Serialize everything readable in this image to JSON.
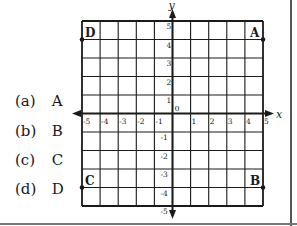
{
  "options": [
    {
      "label": "(a)",
      "value": "A"
    },
    {
      "label": "(b)",
      "value": "B"
    },
    {
      "label": "(c)",
      "value": "C"
    },
    {
      "label": "(d)",
      "value": "D"
    }
  ],
  "grid": {
    "x_axis_label": "x",
    "y_axis_label": "y",
    "origin_label": "0",
    "x_ticks": [
      "-5",
      "-4",
      "-3",
      "-2",
      "-1",
      "1",
      "2",
      "3",
      "4",
      "5"
    ],
    "y_ticks": [
      "5",
      "4",
      "3",
      "2",
      "1",
      "-1",
      "-2",
      "-3",
      "-4",
      "-5"
    ],
    "range": {
      "xmin": -5,
      "xmax": 5,
      "ymin": -5,
      "ymax": 5
    }
  },
  "points": [
    {
      "name": "A",
      "x": 5,
      "y": 4
    },
    {
      "name": "B",
      "x": 5,
      "y": -4
    },
    {
      "name": "C",
      "x": -5,
      "y": -4
    },
    {
      "name": "D",
      "x": -5,
      "y": 4
    }
  ],
  "colors": {
    "line": "#1a1a1a",
    "background": "#ffffff"
  }
}
